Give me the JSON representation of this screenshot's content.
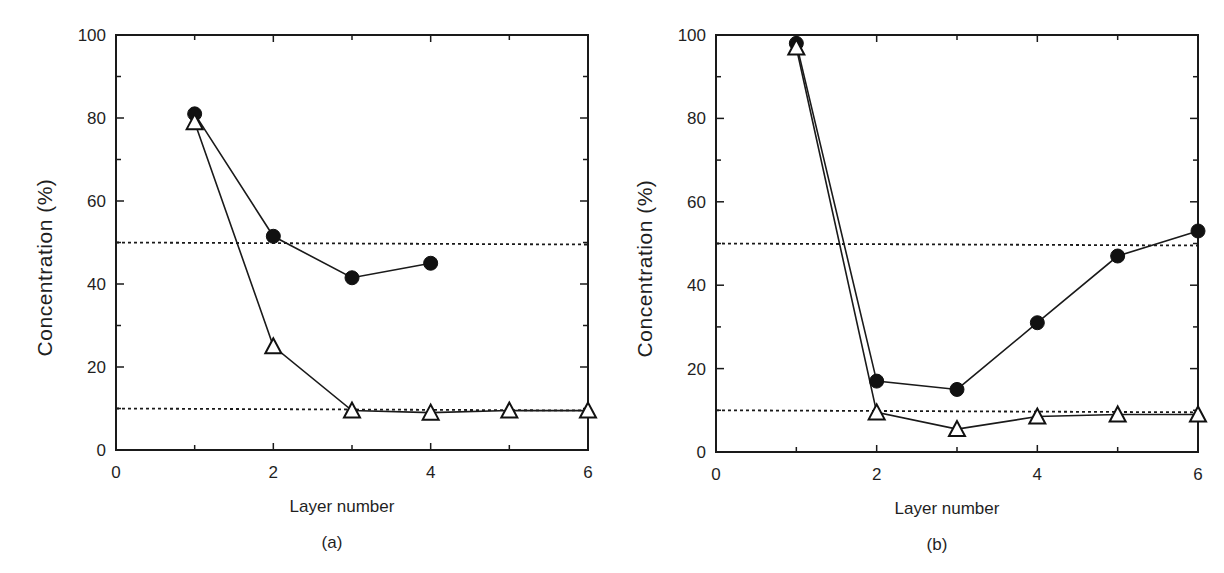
{
  "figure": {
    "panels": [
      {
        "id": "a",
        "caption": "(a)",
        "xlabel": "Layer number",
        "ylabel": "Concentration  (%)",
        "x_ticks": [
          "0",
          "2",
          "4",
          "6"
        ],
        "y_ticks": [
          "0",
          "20",
          "40",
          "60",
          "80",
          "100"
        ]
      },
      {
        "id": "b",
        "caption": "(b)",
        "xlabel": "Layer number",
        "ylabel": "Concentration  (%)",
        "x_ticks": [
          "0",
          "2",
          "4",
          "6"
        ],
        "y_ticks": [
          "0",
          "20",
          "40",
          "60",
          "80",
          "100"
        ]
      }
    ]
  },
  "chart_data": [
    {
      "type": "line",
      "title": "(a)",
      "xlabel": "Layer number",
      "ylabel": "Concentration (%)",
      "xlim": [
        0,
        6
      ],
      "ylim": [
        0,
        100
      ],
      "x_ticks": [
        0,
        2,
        4,
        6
      ],
      "y_ticks": [
        0,
        20,
        40,
        60,
        80,
        100
      ],
      "grid": false,
      "legend": null,
      "series": [
        {
          "name": "filled circles",
          "marker": "filled-circle",
          "x": [
            1,
            2,
            3,
            4
          ],
          "values": [
            81,
            51.5,
            41.5,
            45
          ]
        },
        {
          "name": "open triangles",
          "marker": "open-triangle",
          "x": [
            1,
            2,
            3,
            4,
            5,
            6
          ],
          "values": [
            79,
            25,
            9.5,
            9,
            9.5,
            9.5
          ]
        }
      ],
      "reference_lines": [
        {
          "style": "dotted",
          "y": 50
        },
        {
          "style": "dotted",
          "y": 10
        }
      ]
    },
    {
      "type": "line",
      "title": "(b)",
      "xlabel": "Layer number",
      "ylabel": "Concentration (%)",
      "xlim": [
        0,
        6
      ],
      "ylim": [
        0,
        100
      ],
      "x_ticks": [
        0,
        2,
        4,
        6
      ],
      "y_ticks": [
        0,
        20,
        40,
        60,
        80,
        100
      ],
      "grid": false,
      "legend": null,
      "series": [
        {
          "name": "filled circles",
          "marker": "filled-circle",
          "x": [
            1,
            2,
            3,
            4,
            5,
            6
          ],
          "values": [
            98,
            17,
            15,
            31,
            47,
            53
          ]
        },
        {
          "name": "open triangles",
          "marker": "open-triangle",
          "x": [
            1,
            2,
            3,
            4,
            5,
            6
          ],
          "values": [
            97,
            9.5,
            5.5,
            8.5,
            9,
            9
          ]
        }
      ],
      "reference_lines": [
        {
          "style": "dotted",
          "y": 50
        },
        {
          "style": "dotted",
          "y": 10
        }
      ]
    }
  ]
}
